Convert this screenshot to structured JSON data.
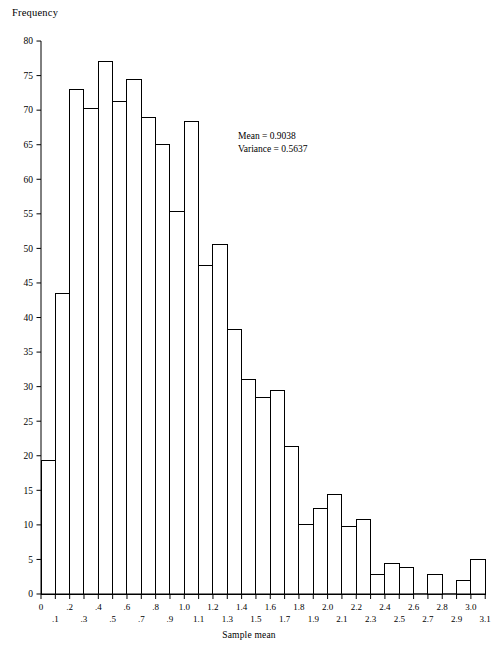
{
  "chart_data": {
    "type": "bar",
    "title": "",
    "xlabel": "Sample mean",
    "ylabel": "Frequency",
    "xlim": [
      0,
      3.1
    ],
    "ylim": [
      0,
      80
    ],
    "bin_width": 0.1,
    "grid": false,
    "legend": null,
    "x_tick_labels": [
      "0",
      ".1",
      ".2",
      ".3",
      ".4",
      ".5",
      ".6",
      ".7",
      ".8",
      ".9",
      "1.0",
      "1.1",
      "1.2",
      "1.3",
      "1.4",
      "1.5",
      "1.6",
      "1.7",
      "1.8",
      "1.9",
      "2.0",
      "2.1",
      "2.2",
      "2.3",
      "2.4",
      "2.5",
      "2.6",
      "2.7",
      "2.8",
      "2.9",
      "3.0",
      "3.1"
    ],
    "y_tick_labels": [
      "0",
      "5",
      "10",
      "15",
      "20",
      "25",
      "30",
      "35",
      "40",
      "45",
      "50",
      "55",
      "60",
      "65",
      "70",
      "75",
      "80"
    ],
    "y_ticks": [
      0,
      5,
      10,
      15,
      20,
      25,
      30,
      35,
      40,
      45,
      50,
      55,
      60,
      65,
      70,
      75,
      80
    ],
    "bin_starts": [
      0,
      0.1,
      0.2,
      0.3,
      0.4,
      0.5,
      0.6,
      0.7,
      0.8,
      0.9,
      1.0,
      1.1,
      1.2,
      1.3,
      1.4,
      1.5,
      1.6,
      1.7,
      1.8,
      1.9,
      2.0,
      2.1,
      2.2,
      2.3,
      2.4,
      2.5,
      2.6,
      2.7,
      2.8,
      2.9,
      3.0
    ],
    "categories": [
      "0-.1",
      ".1-.2",
      ".2-.3",
      ".3-.4",
      ".4-.5",
      ".5-.6",
      ".6-.7",
      ".7-.8",
      ".8-.9",
      ".9-1.0",
      "1.0-1.1",
      "1.1-1.2",
      "1.2-1.3",
      "1.3-1.4",
      "1.4-1.5",
      "1.5-1.6",
      "1.6-1.7",
      "1.7-1.8",
      "1.8-1.9",
      "1.9-2.0",
      "2.0-2.1",
      "2.1-2.2",
      "2.2-2.3",
      "2.3-2.4",
      "2.4-2.5",
      "2.5-2.6",
      "2.6-2.7",
      "2.7-2.8",
      "2.8-2.9",
      "2.9-3.0",
      "3.0-3.1"
    ],
    "values": [
      19.3,
      43.5,
      73.0,
      70.2,
      77.1,
      71.2,
      74.4,
      69.0,
      65.1,
      55.3,
      68.3,
      47.5,
      50.5,
      38.2,
      31.1,
      28.5,
      29.4,
      21.4,
      10.0,
      12.3,
      14.4,
      9.7,
      10.8,
      2.8,
      4.4,
      3.9,
      0,
      2.8,
      0,
      1.9,
      5.0
    ],
    "annotations": [
      "Mean = 0.9038",
      "Variance = 0.5637"
    ],
    "bar_fill": "#ffffff",
    "bar_stroke": "#000000",
    "axis_color": "#000000"
  },
  "statistics": {
    "mean_label": "Mean = 0.9038",
    "variance_label": "Variance = 0.5637"
  },
  "axes": {
    "y_axis_title": "Frequency",
    "x_axis_title": "Sample mean"
  }
}
